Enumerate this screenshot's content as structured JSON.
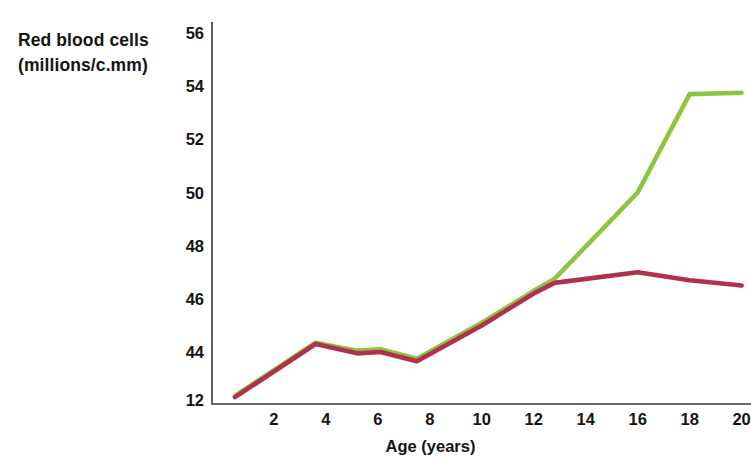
{
  "chart_data": {
    "type": "line",
    "title": "",
    "ylabel": "Red blood cells (millions/c.mm)",
    "ylabel_line1": "Red blood cells",
    "ylabel_line2": "(millions/c.mm)",
    "xlabel": "Age (years)",
    "xlim": [
      0,
      21
    ],
    "ylim": [
      42,
      56
    ],
    "grid": false,
    "legend": "none",
    "yticks": [
      "12",
      "44",
      "46",
      "48",
      "50",
      "52",
      "54",
      "56"
    ],
    "ytick_values": [
      42,
      44,
      46,
      48,
      50,
      52,
      54,
      56
    ],
    "xticks": [
      "2",
      "4",
      "6",
      "8",
      "10",
      "12",
      "14",
      "16",
      "18",
      "20"
    ],
    "xtick_values": [
      2,
      4,
      6,
      8,
      10,
      12,
      14,
      16,
      18,
      20
    ],
    "series": [
      {
        "name": "green-series",
        "color": "#8CC63F",
        "x": [
          0.5,
          3.6,
          5.2,
          6.1,
          7.5,
          10.0,
          12.0,
          12.8,
          16.0,
          18.0,
          20.0
        ],
        "values": [
          42.35,
          44.35,
          44.05,
          44.1,
          43.75,
          45.1,
          46.3,
          46.75,
          50.0,
          53.7,
          53.75
        ]
      },
      {
        "name": "red-series",
        "color": "#B0304E",
        "x": [
          0.5,
          3.6,
          5.2,
          6.1,
          7.5,
          10.0,
          12.0,
          12.8,
          16.0,
          18.0,
          20.0
        ],
        "values": [
          42.3,
          44.3,
          43.95,
          44.0,
          43.65,
          45.0,
          46.2,
          46.6,
          47.0,
          46.7,
          46.5
        ]
      }
    ]
  },
  "axes": {
    "y_axis_name": "y-axis",
    "x_axis_name": "x-axis"
  }
}
